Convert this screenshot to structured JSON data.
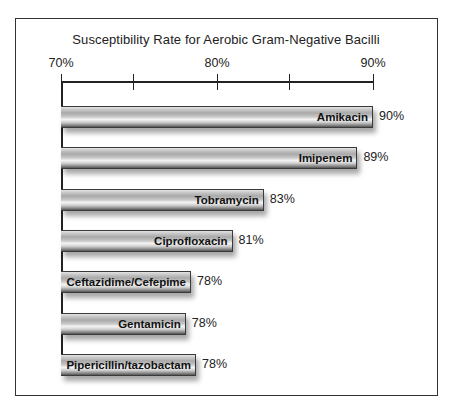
{
  "chart_data": {
    "type": "bar",
    "orientation": "horizontal",
    "title": "Susceptibility Rate for Aerobic Gram-Negative Bacilli",
    "xlabel": "",
    "ylabel": "",
    "xlim": [
      70,
      90
    ],
    "axis_position": "top",
    "grid": false,
    "legend": null,
    "ticks": [
      {
        "value": 70,
        "label": "70%"
      },
      {
        "value": 75,
        "label": ""
      },
      {
        "value": 80,
        "label": "80%"
      },
      {
        "value": 85,
        "label": ""
      },
      {
        "value": 90,
        "label": "90%"
      }
    ],
    "categories": [
      "Amikacin",
      "Imipenem",
      "Tobramycin",
      "Ciprofloxacin",
      "Ceftazidime/Cefepime",
      "Gentamicin",
      "Pipericillin/tazobactam"
    ],
    "values": [
      90,
      89,
      83,
      81,
      78,
      78,
      78
    ],
    "value_labels": [
      "90%",
      "89%",
      "83%",
      "81%",
      "78%",
      "78%",
      "78%"
    ]
  },
  "colors": {
    "frame": "#333333",
    "bar_fill": "#c0c0c0",
    "bar_border": "#3a3a3a",
    "text": "#222222"
  }
}
